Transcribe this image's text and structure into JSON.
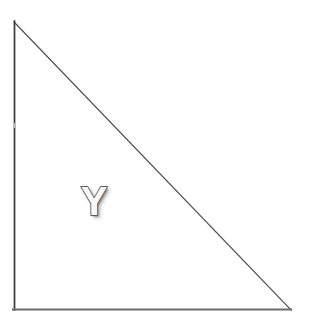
{
  "figure": {
    "type": "right-triangle",
    "background_color": "#ffffff",
    "canvas": {
      "width": 310,
      "height": 318
    },
    "vertices": [
      {
        "name": "apex",
        "x": 14,
        "y": 22
      },
      {
        "name": "bottom-left",
        "x": 14,
        "y": 310
      },
      {
        "name": "bottom-right",
        "x": 291,
        "y": 310
      }
    ],
    "edges": [
      {
        "name": "vertical-leg",
        "from": "apex",
        "to": "bottom-left",
        "color": "#3a3a3a",
        "width": 1.7
      },
      {
        "name": "horizontal-leg",
        "from": "bottom-left",
        "to": "bottom-right",
        "color": "#6a6a6a",
        "width": 2.0
      },
      {
        "name": "hypotenuse",
        "from": "apex",
        "to": "bottom-right",
        "color": "#4a4a4a",
        "width": 1.2
      }
    ],
    "fill": "none",
    "labels": [
      {
        "name": "vertex-label-y",
        "text": "Y",
        "x": 94,
        "y": 201,
        "style": "embossed",
        "fill_color": "#fbfbfb",
        "outline_color": "#3a3a3a",
        "shadow_color": "#5a5a5a",
        "font_size": 40,
        "font_weight": "bold"
      }
    ]
  }
}
